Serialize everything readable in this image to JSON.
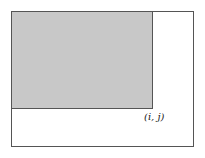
{
  "diagram": {
    "outer_rect": {
      "fill": "#ffffff",
      "stroke": "#555555"
    },
    "shaded_rect": {
      "fill": "#c8c8c8",
      "stroke": "#555555"
    },
    "corner_label": "(i, j)"
  }
}
